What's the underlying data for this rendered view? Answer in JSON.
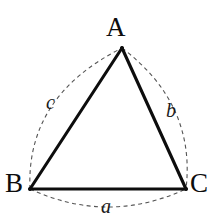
{
  "figure": {
    "background_color": "#ffffff",
    "ink_color": "#0d0d0d",
    "dash_color": "#555555",
    "width": 219,
    "height": 215
  },
  "vertices": [
    {
      "key": "A",
      "label": "A",
      "x": 122,
      "y": 48
    },
    {
      "key": "B",
      "label": "B",
      "x": 30,
      "y": 189
    },
    {
      "key": "C",
      "label": "C",
      "x": 186,
      "y": 189
    }
  ],
  "sides": [
    {
      "key": "a",
      "label": "a",
      "between": "B-C",
      "style": "dashed-arc",
      "bulge": "down"
    },
    {
      "key": "b",
      "label": "b",
      "between": "A-C",
      "style": "dashed-arc",
      "bulge": "right"
    },
    {
      "key": "c",
      "label": "c",
      "between": "B-A",
      "style": "dashed-arc",
      "bulge": "left"
    }
  ],
  "edges": [
    {
      "key": "AB",
      "from": "A",
      "to": "B",
      "style": "solid"
    },
    {
      "key": "AC",
      "from": "A",
      "to": "C",
      "style": "solid"
    },
    {
      "key": "BC",
      "from": "B",
      "to": "C",
      "style": "solid"
    }
  ]
}
